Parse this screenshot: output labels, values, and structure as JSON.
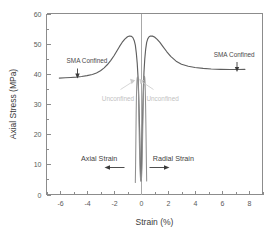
{
  "chart_data": {
    "type": "line",
    "title": "",
    "xlabel": "Strain (%)",
    "ylabel": "Axial Stress (MPa)",
    "xlim": [
      -7,
      9
    ],
    "ylim": [
      0,
      60
    ],
    "xticks": [
      -6,
      -4,
      -2,
      0,
      2,
      4,
      6,
      8
    ],
    "xtick_labels": [
      "-6",
      "-4",
      "-2",
      "0",
      "2",
      "4",
      "6",
      "8"
    ],
    "yticks": [
      0,
      10,
      20,
      30,
      40,
      50,
      60
    ],
    "ytick_labels": [
      "0",
      "10",
      "20",
      "30",
      "40",
      "50",
      "60"
    ],
    "grid": false,
    "legend": "none",
    "series": [
      {
        "name": "SMA Confined - Axial Strain",
        "color": "#5f5f5f",
        "points": [
          [
            -6.05,
            38.6
          ],
          [
            -5.6,
            38.7
          ],
          [
            -5.2,
            38.8
          ],
          [
            -4.8,
            38.9
          ],
          [
            -4.4,
            39.1
          ],
          [
            -4.0,
            39.4
          ],
          [
            -3.6,
            39.8
          ],
          [
            -3.3,
            40.3
          ],
          [
            -3.0,
            41.0
          ],
          [
            -2.75,
            41.9
          ],
          [
            -2.5,
            43.0
          ],
          [
            -2.25,
            44.4
          ],
          [
            -2.0,
            46.0
          ],
          [
            -1.8,
            47.5
          ],
          [
            -1.6,
            49.0
          ],
          [
            -1.4,
            50.4
          ],
          [
            -1.2,
            51.5
          ],
          [
            -1.0,
            52.3
          ],
          [
            -0.85,
            52.55
          ],
          [
            -0.7,
            52.4
          ],
          [
            -0.6,
            52.0
          ],
          [
            -0.5,
            51.0
          ],
          [
            -0.42,
            49.5
          ],
          [
            -0.35,
            47.0
          ],
          [
            -0.28,
            43.5
          ],
          [
            -0.22,
            39.0
          ],
          [
            -0.17,
            33.0
          ],
          [
            -0.13,
            26.0
          ],
          [
            -0.09,
            19.0
          ],
          [
            -0.06,
            12.5
          ],
          [
            -0.04,
            8.5
          ],
          [
            -0.02,
            5.6
          ],
          [
            -0.01,
            4.8
          ]
        ]
      },
      {
        "name": "SMA Confined - Radial Strain",
        "color": "#5f5f5f",
        "points": [
          [
            0.01,
            4.8
          ],
          [
            0.02,
            5.6
          ],
          [
            0.04,
            9.0
          ],
          [
            0.06,
            13.5
          ],
          [
            0.09,
            20.0
          ],
          [
            0.13,
            27.5
          ],
          [
            0.17,
            34.5
          ],
          [
            0.22,
            40.5
          ],
          [
            0.28,
            45.0
          ],
          [
            0.35,
            48.3
          ],
          [
            0.42,
            50.4
          ],
          [
            0.5,
            51.6
          ],
          [
            0.6,
            52.3
          ],
          [
            0.7,
            52.55
          ],
          [
            0.85,
            52.5
          ],
          [
            1.0,
            52.2
          ],
          [
            1.2,
            51.4
          ],
          [
            1.4,
            50.4
          ],
          [
            1.6,
            49.2
          ],
          [
            1.9,
            47.4
          ],
          [
            2.2,
            45.8
          ],
          [
            2.6,
            44.2
          ],
          [
            3.0,
            43.2
          ],
          [
            3.5,
            42.5
          ],
          [
            4.0,
            42.1
          ],
          [
            4.6,
            41.8
          ],
          [
            5.2,
            41.6
          ],
          [
            5.9,
            41.5
          ],
          [
            6.6,
            41.45
          ],
          [
            7.2,
            41.45
          ],
          [
            7.7,
            41.5
          ]
        ]
      },
      {
        "name": "Unconfined - Axial Strain",
        "color": "#8f8f8f",
        "points": [
          [
            -0.42,
            4.0
          ],
          [
            -0.4,
            10.0
          ],
          [
            -0.38,
            18.0
          ],
          [
            -0.36,
            26.0
          ],
          [
            -0.34,
            32.0
          ],
          [
            -0.32,
            35.5
          ],
          [
            -0.3,
            37.6
          ],
          [
            -0.28,
            38.6
          ],
          [
            -0.26,
            39.0
          ],
          [
            -0.24,
            38.8
          ],
          [
            -0.22,
            38.0
          ],
          [
            -0.2,
            36.0
          ],
          [
            -0.18,
            32.0
          ],
          [
            -0.16,
            27.0
          ],
          [
            -0.14,
            22.0
          ],
          [
            -0.12,
            17.0
          ],
          [
            -0.1,
            13.0
          ],
          [
            -0.08,
            9.5
          ],
          [
            -0.06,
            7.0
          ],
          [
            -0.04,
            5.4
          ],
          [
            -0.02,
            4.6
          ],
          [
            -0.01,
            4.4
          ]
        ]
      },
      {
        "name": "Unconfined - Radial Strain",
        "color": "#8f8f8f",
        "points": [
          [
            0.01,
            4.4
          ],
          [
            0.02,
            4.6
          ],
          [
            0.04,
            5.6
          ],
          [
            0.06,
            7.5
          ],
          [
            0.08,
            10.5
          ],
          [
            0.1,
            14.5
          ],
          [
            0.12,
            19.0
          ],
          [
            0.14,
            24.0
          ],
          [
            0.16,
            29.0
          ],
          [
            0.18,
            33.5
          ],
          [
            0.2,
            36.5
          ],
          [
            0.22,
            38.3
          ],
          [
            0.24,
            39.1
          ],
          [
            0.26,
            39.2
          ],
          [
            0.28,
            38.6
          ],
          [
            0.3,
            37.0
          ],
          [
            0.32,
            34.0
          ],
          [
            0.34,
            29.5
          ],
          [
            0.36,
            24.0
          ],
          [
            0.38,
            17.5
          ],
          [
            0.4,
            10.5
          ],
          [
            0.42,
            4.5
          ]
        ]
      }
    ],
    "annotations": [
      {
        "id": "sma-confined-left",
        "text": "SMA Confined",
        "x": -4.0,
        "y": 43.5,
        "style": "dark"
      },
      {
        "id": "sma-confined-right",
        "text": "SMA Confined",
        "x": 6.9,
        "y": 45.5,
        "style": "dark"
      },
      {
        "id": "unconfined-left",
        "text": "Unconfined",
        "x": -1.7,
        "y": 31.0,
        "style": "light"
      },
      {
        "id": "unconfined-right",
        "text": "Unconfined",
        "x": 1.6,
        "y": 31.0,
        "style": "light"
      },
      {
        "id": "axial-strain-label",
        "text": "Axial Strain",
        "x": -3.1,
        "y": 11.0,
        "style": "inline"
      },
      {
        "id": "radial-strain-label",
        "text": "Radial Strain",
        "x": 2.4,
        "y": 11.0,
        "style": "inline"
      }
    ]
  }
}
